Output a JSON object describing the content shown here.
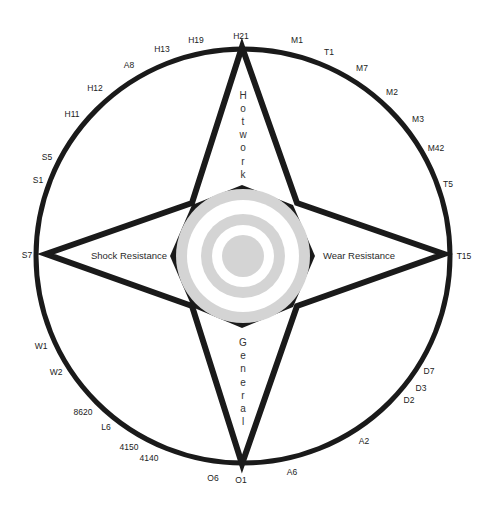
{
  "diagram": {
    "colors": {
      "stroke": "#1a1a1a",
      "background": "#ffffff",
      "target_gray": "#d4d4d4",
      "target_white": "#ffffff",
      "text": "#222222"
    },
    "axes": {
      "top": "Hotwork",
      "bottom": "General",
      "left": "Shock Resistance",
      "right": "Wear Resistance"
    },
    "steel_grades": [
      {
        "label": "H21",
        "x": 241,
        "y": 37
      },
      {
        "label": "H19",
        "x": 196,
        "y": 41
      },
      {
        "label": "H13",
        "x": 162,
        "y": 50
      },
      {
        "label": "A8",
        "x": 129,
        "y": 66
      },
      {
        "label": "H12",
        "x": 95,
        "y": 89
      },
      {
        "label": "H11",
        "x": 72,
        "y": 115
      },
      {
        "label": "S5",
        "x": 47,
        "y": 158
      },
      {
        "label": "S1",
        "x": 38,
        "y": 181
      },
      {
        "label": "S7",
        "x": 27,
        "y": 256
      },
      {
        "label": "W1",
        "x": 41,
        "y": 347
      },
      {
        "label": "W2",
        "x": 56,
        "y": 373
      },
      {
        "label": "8620",
        "x": 83,
        "y": 413
      },
      {
        "label": "L6",
        "x": 106,
        "y": 428
      },
      {
        "label": "4150",
        "x": 129,
        "y": 448
      },
      {
        "label": "4140",
        "x": 149,
        "y": 459
      },
      {
        "label": "O6",
        "x": 213,
        "y": 479
      },
      {
        "label": "O1",
        "x": 241,
        "y": 481
      },
      {
        "label": "A6",
        "x": 292,
        "y": 473
      },
      {
        "label": "A2",
        "x": 364,
        "y": 442
      },
      {
        "label": "D2",
        "x": 409,
        "y": 401
      },
      {
        "label": "D3",
        "x": 421,
        "y": 389
      },
      {
        "label": "D7",
        "x": 429,
        "y": 372
      },
      {
        "label": "T15",
        "x": 464,
        "y": 257
      },
      {
        "label": "T5",
        "x": 448,
        "y": 185
      },
      {
        "label": "M42",
        "x": 436,
        "y": 149
      },
      {
        "label": "M3",
        "x": 418,
        "y": 120
      },
      {
        "label": "M2",
        "x": 392,
        "y": 93
      },
      {
        "label": "M7",
        "x": 362,
        "y": 69
      },
      {
        "label": "T1",
        "x": 329,
        "y": 53
      },
      {
        "label": "M1",
        "x": 297,
        "y": 41
      }
    ]
  }
}
